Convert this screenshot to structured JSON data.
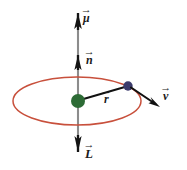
{
  "figure": {
    "canvas": {
      "width": 187,
      "height": 170,
      "background": "#ffffff"
    },
    "labels": {
      "mu": {
        "symbol": "μ",
        "accent": "→",
        "name": "magnetic-moment-vector"
      },
      "n": {
        "symbol": "n",
        "accent": "→",
        "name": "normal-vector"
      },
      "r": {
        "symbol": "r",
        "accent": "→",
        "name": "radius-vector"
      },
      "v": {
        "symbol": "v",
        "accent": "→",
        "name": "velocity-vector"
      },
      "L": {
        "symbol": "L",
        "accent": "→",
        "name": "angular-momentum-vector"
      }
    },
    "colors": {
      "orbit": "#c8503c",
      "axis": "#8c8c8c",
      "arrowhead": "#1a1a1a",
      "vector_line": "#111111",
      "nucleus": "#2d6b35",
      "particle": "#3b3a6b",
      "label": "#1a1a1a"
    },
    "geometry": {
      "axis": {
        "x": 78,
        "y_top": 12,
        "y_bottom": 152
      },
      "orbit_ellipse": {
        "cx": 77,
        "cy": 101,
        "rx": 64,
        "ry": 24
      },
      "nucleus_dot": {
        "cx": 78,
        "cy": 101,
        "r": 7
      },
      "particle_dot": {
        "cx": 128,
        "cy": 86,
        "r": 4.6
      },
      "r_vector": {
        "x1": 80,
        "y1": 100,
        "x2": 126,
        "y2": 87
      },
      "v_vector": {
        "x1": 132,
        "y1": 88,
        "x2": 160,
        "y2": 107
      },
      "mu_arrow_tip_y": 13,
      "n_arrow_tip_y": 58,
      "L_arrow_tip_y": 151
    }
  }
}
